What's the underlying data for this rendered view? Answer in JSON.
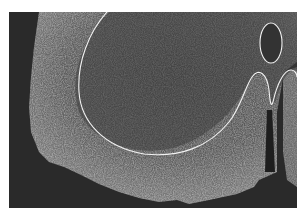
{
  "image": {
    "description": "Grayscale micrograph of a tissue cross-section (spinal cord hemisection) with white outline annotations",
    "background_color": "#ffffff",
    "frame_color": "#2a2a2a",
    "tissue_color": "#6e6e6e",
    "annotation_color": "#ffffff"
  },
  "annotations": [
    {
      "name": "gray-matter-outline",
      "shape": "curve"
    },
    {
      "name": "oval-region-outline",
      "shape": "ellipse"
    },
    {
      "name": "wave-outline",
      "shape": "curve"
    }
  ]
}
